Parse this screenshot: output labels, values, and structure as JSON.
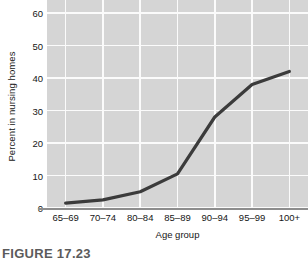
{
  "chart_data": {
    "type": "line",
    "title": "",
    "xlabel": "Age group",
    "ylabel": "Percent in nursing homes",
    "categories": [
      "65–69",
      "70–74",
      "80–84",
      "85–89",
      "90–94",
      "95–99",
      "100+"
    ],
    "values": [
      1.5,
      2.5,
      5,
      10.5,
      28,
      38,
      42
    ],
    "series": [
      {
        "name": "Percent in nursing homes",
        "values": [
          1.5,
          2.5,
          5,
          10.5,
          28,
          38,
          42
        ]
      }
    ],
    "ylim": [
      0,
      64
    ],
    "yticks": [
      0,
      10,
      20,
      30,
      40,
      50,
      60
    ],
    "ytick_labels": [
      "0",
      "10",
      "20",
      "30",
      "40",
      "50",
      "60"
    ],
    "grid": true,
    "legend": "none",
    "line_color": "#3b3b3b",
    "plot_background": "#d5d5d5",
    "gridline_color": "#fbfbfb",
    "axis_color": "#8d8d8d"
  },
  "caption": {
    "text": "FIGURE 17.23"
  }
}
